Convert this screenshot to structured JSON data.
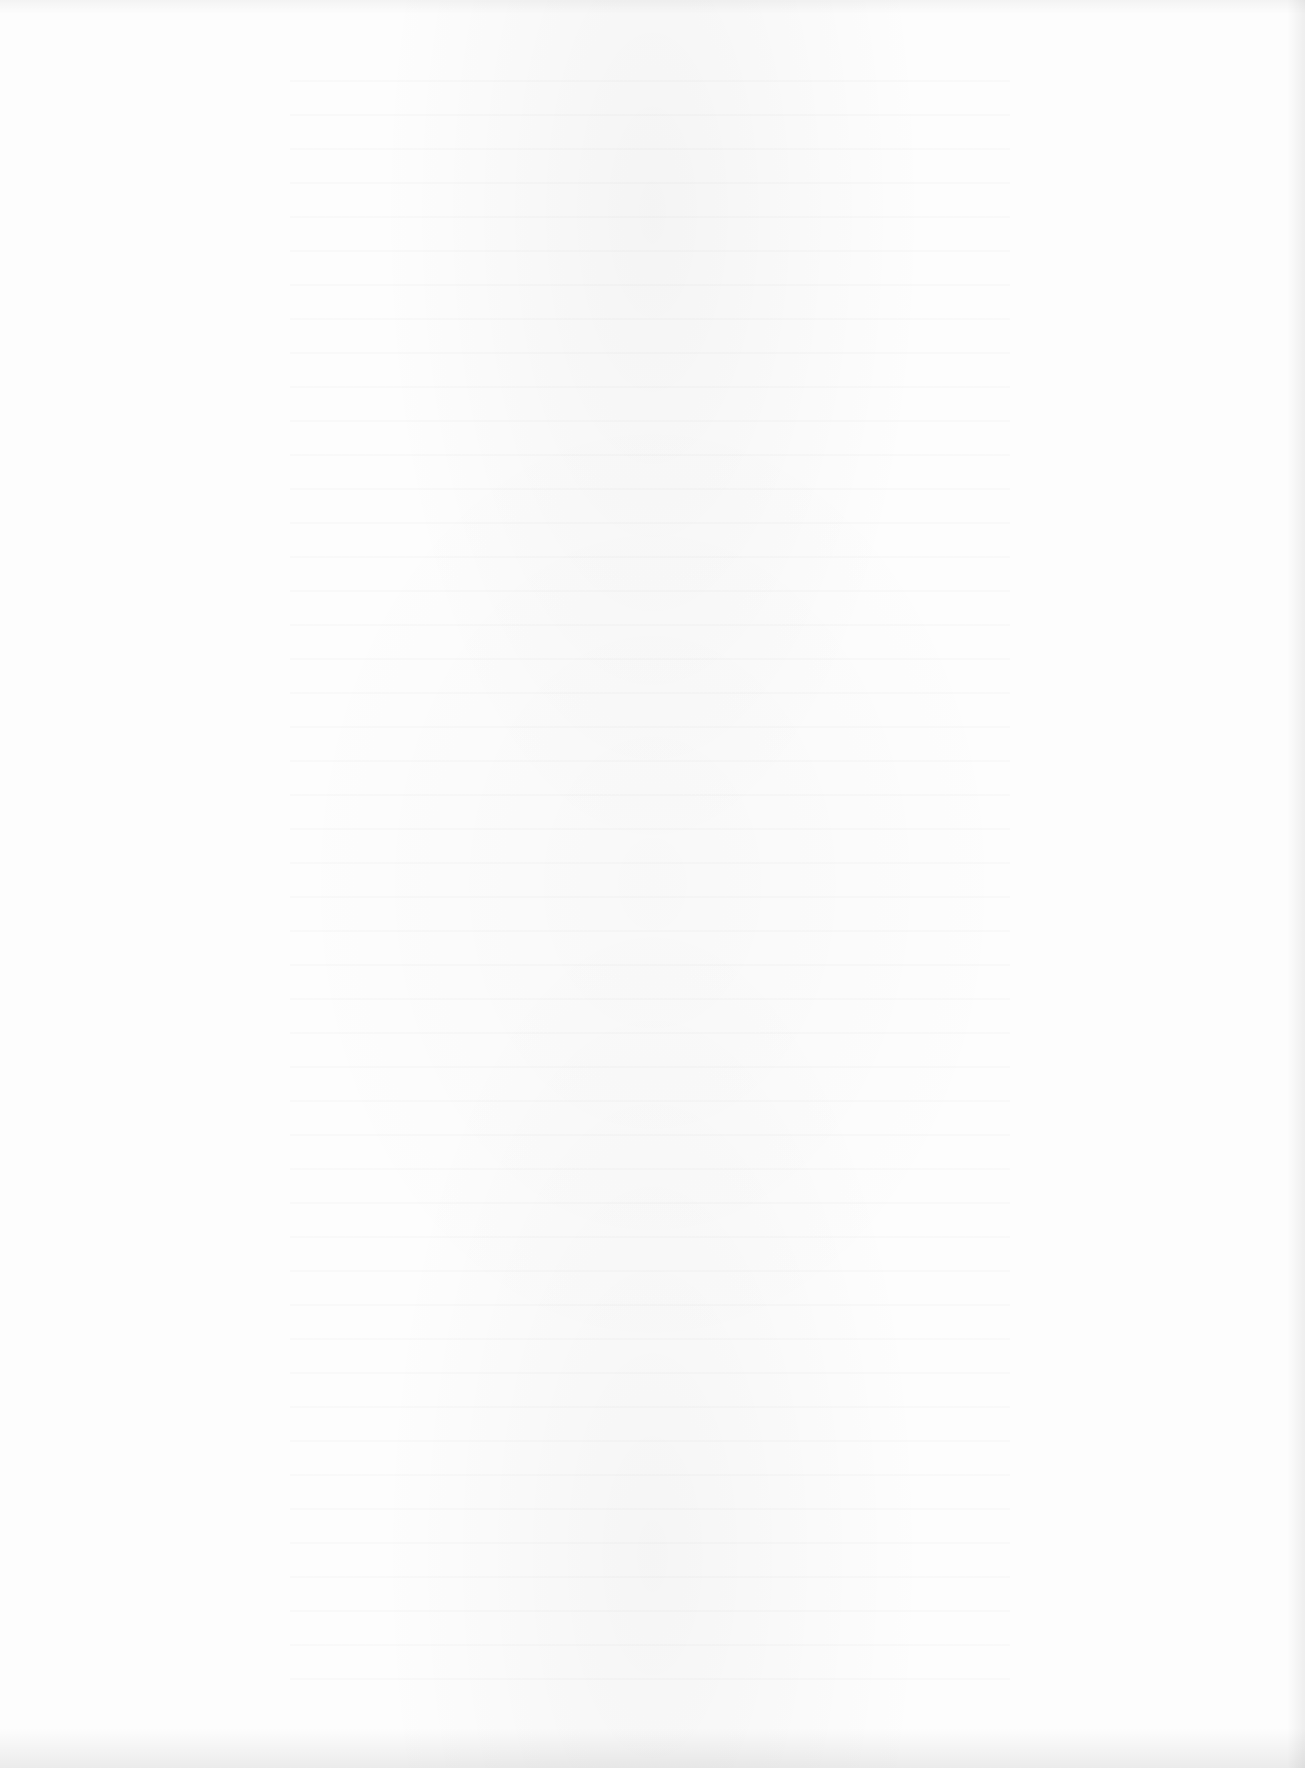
{
  "document": {
    "type": "scanned-page",
    "content": "",
    "colors": {
      "paper": "#fdfdfd",
      "edge_shadow": "#e8e8e8"
    }
  }
}
